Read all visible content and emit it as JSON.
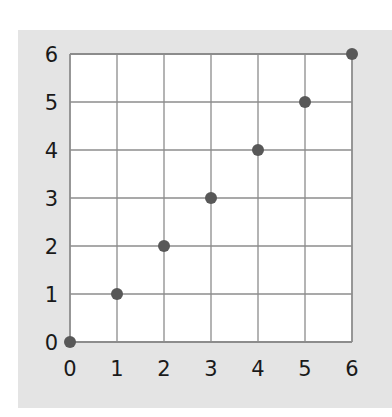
{
  "chart_data": {
    "type": "scatter",
    "title": "",
    "xlabel": "",
    "ylabel": "",
    "xlim": [
      0,
      6
    ],
    "ylim": [
      0,
      6
    ],
    "grid": true,
    "x_ticks": [
      "0",
      "1",
      "2",
      "3",
      "4",
      "5",
      "6"
    ],
    "y_ticks": [
      "0",
      "1",
      "2",
      "3",
      "4",
      "5",
      "6"
    ],
    "points": [
      {
        "x": 0,
        "y": 0
      },
      {
        "x": 1,
        "y": 1
      },
      {
        "x": 2,
        "y": 2
      },
      {
        "x": 3,
        "y": 3
      },
      {
        "x": 4,
        "y": 4
      },
      {
        "x": 5,
        "y": 5
      },
      {
        "x": 6,
        "y": 6
      }
    ],
    "x": [
      0,
      1,
      2,
      3,
      4,
      5,
      6
    ],
    "y": [
      0,
      1,
      2,
      3,
      4,
      5,
      6
    ],
    "legend": null
  },
  "colors": {
    "panel_background": "#e4e4e4",
    "plot_background": "#ffffff",
    "grid_line": "#8c8c8c",
    "point": "#585858",
    "tick_text": "#1a1a1a"
  }
}
